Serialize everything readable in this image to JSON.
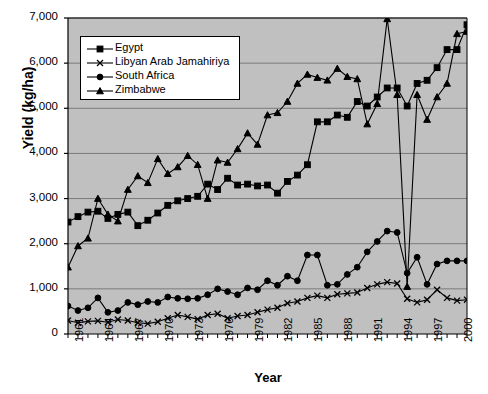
{
  "chart_data": {
    "type": "line",
    "title": "",
    "xlabel": "Year",
    "ylabel": "Yield (kg/ha)",
    "xlim": [
      1961,
      2001
    ],
    "ylim": [
      0,
      7000
    ],
    "ytick_values": [
      0,
      1000,
      2000,
      3000,
      4000,
      5000,
      6000,
      7000
    ],
    "ytick_labels": [
      "0",
      "1,000",
      "2,000",
      "3,000",
      "4,000",
      "5,000",
      "6,000",
      "7,000"
    ],
    "xtick_values": [
      1961,
      1964,
      1967,
      1970,
      1973,
      1976,
      1979,
      1982,
      1985,
      1988,
      1991,
      1994,
      1997,
      2000
    ],
    "xtick_labels": [
      "1961",
      "1964",
      "1967",
      "1970",
      "1973",
      "1976",
      "1979",
      "1982",
      "1985",
      "1988",
      "1991",
      "1994",
      "1997",
      "2000"
    ],
    "grid": "horizontal",
    "legend_position": "top-left",
    "plot_background": "#c0c0c0",
    "line_color": "#000000",
    "x": [
      1961,
      1962,
      1963,
      1964,
      1965,
      1966,
      1967,
      1968,
      1969,
      1970,
      1971,
      1972,
      1973,
      1974,
      1975,
      1976,
      1977,
      1978,
      1979,
      1980,
      1981,
      1982,
      1983,
      1984,
      1985,
      1986,
      1987,
      1988,
      1989,
      1990,
      1991,
      1992,
      1993,
      1994,
      1995,
      1996,
      1997,
      1998,
      1999,
      2000,
      2001
    ],
    "series": [
      {
        "name": "Egypt",
        "marker": "square",
        "values": [
          2480,
          2600,
          2700,
          2720,
          2560,
          2650,
          2700,
          2400,
          2520,
          2680,
          2850,
          2950,
          3000,
          3050,
          3320,
          3200,
          3450,
          3300,
          3320,
          3280,
          3300,
          3120,
          3380,
          3520,
          3750,
          4700,
          4700,
          4850,
          4800,
          5150,
          5050,
          5250,
          5450,
          5450,
          5050,
          5550,
          5620,
          5900,
          6300,
          6300,
          6850
        ]
      },
      {
        "name": "Libyan Arab Jamahiriya",
        "marker": "cross",
        "values": [
          300,
          250,
          280,
          290,
          260,
          320,
          300,
          250,
          230,
          270,
          350,
          420,
          380,
          330,
          420,
          450,
          350,
          400,
          420,
          480,
          540,
          580,
          680,
          720,
          800,
          850,
          800,
          880,
          900,
          920,
          1020,
          1100,
          1150,
          1120,
          780,
          700,
          760,
          980,
          800,
          740,
          760
        ]
      },
      {
        "name": "South Africa",
        "marker": "circle",
        "values": [
          620,
          520,
          580,
          800,
          480,
          520,
          700,
          650,
          720,
          700,
          820,
          790,
          780,
          790,
          870,
          1000,
          940,
          870,
          1020,
          980,
          1180,
          1080,
          1280,
          1180,
          1750,
          1750,
          1080,
          1100,
          1320,
          1480,
          1820,
          2050,
          2280,
          2250,
          1350,
          1700,
          1100,
          1550,
          1620,
          1620,
          1620
        ]
      },
      {
        "name": "Zimbabwe",
        "marker": "triangle",
        "values": [
          1480,
          1950,
          2120,
          3000,
          2650,
          2500,
          3200,
          3500,
          3350,
          3880,
          3550,
          3700,
          3950,
          3750,
          3000,
          3850,
          3800,
          4100,
          4450,
          4200,
          4850,
          4900,
          5150,
          5550,
          5750,
          5680,
          5620,
          5880,
          5700,
          5650,
          4650,
          5100,
          6980,
          5300,
          1050,
          5300,
          4750,
          5250,
          5550,
          6650,
          6700
        ]
      }
    ]
  }
}
